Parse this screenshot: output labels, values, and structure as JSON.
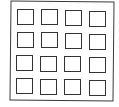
{
  "diagram": {
    "type": "grid-of-squares",
    "rows": 4,
    "cols": 4,
    "stroke_color": "#333333",
    "background": "#ffffff",
    "cells": [
      {
        "r": 0,
        "c": 0,
        "x": 17,
        "y": 9
      },
      {
        "r": 0,
        "c": 1,
        "x": 41,
        "y": 9
      },
      {
        "r": 0,
        "c": 2,
        "x": 65,
        "y": 10
      },
      {
        "r": 0,
        "c": 3,
        "x": 89,
        "y": 11
      },
      {
        "r": 1,
        "c": 0,
        "x": 17,
        "y": 32
      },
      {
        "r": 1,
        "c": 1,
        "x": 41,
        "y": 32
      },
      {
        "r": 1,
        "c": 2,
        "x": 65,
        "y": 33
      },
      {
        "r": 1,
        "c": 3,
        "x": 89,
        "y": 34
      },
      {
        "r": 2,
        "c": 0,
        "x": 16,
        "y": 55
      },
      {
        "r": 2,
        "c": 1,
        "x": 40,
        "y": 56
      },
      {
        "r": 2,
        "c": 2,
        "x": 64,
        "y": 56
      },
      {
        "r": 2,
        "c": 3,
        "x": 89,
        "y": 57
      },
      {
        "r": 3,
        "c": 0,
        "x": 16,
        "y": 78
      },
      {
        "r": 3,
        "c": 1,
        "x": 40,
        "y": 79
      },
      {
        "r": 3,
        "c": 2,
        "x": 64,
        "y": 79
      },
      {
        "r": 3,
        "c": 3,
        "x": 89,
        "y": 80
      }
    ]
  }
}
